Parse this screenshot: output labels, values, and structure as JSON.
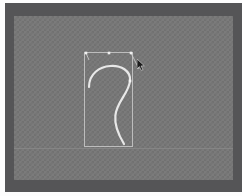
{
  "app": {
    "title": "Vector Path Editor",
    "canvas_label": "drawing-canvas",
    "background_style": "transparency-checkerboard"
  },
  "colors": {
    "page_margin": "#fdfdfd",
    "frame": "#59595b",
    "frame_shade": "#555557",
    "canvas_light": "#7b7b7b",
    "canvas_dark": "#717171",
    "path_stroke": "#e8e8e8",
    "selection_box": "#bdbdbd",
    "handle_line": "#cfcfcf",
    "handle_node": "#f0f0f0",
    "guide": "#969696",
    "cursor": "#1a1a1a"
  },
  "selection": {
    "label": "selection-bounding-box",
    "x": 70,
    "y": 36,
    "width": 48,
    "height": 94
  },
  "path": {
    "label": "bezier-curve-path",
    "stroke_width": 2.2,
    "fill": "none",
    "d": "M 75 71 C 75 44 118 44 116 65 C 114 84 88 92 110 128"
  },
  "handles": [
    {
      "name": "node-handle-top-left",
      "x": 72,
      "y": 37,
      "type": "anchor"
    },
    {
      "name": "node-handle-top-mid",
      "x": 95,
      "y": 37,
      "type": "control"
    },
    {
      "name": "node-handle-top-right",
      "x": 117,
      "y": 37,
      "type": "anchor"
    },
    {
      "name": "node-handle-curve-end",
      "x": 116,
      "y": 65,
      "type": "anchor"
    }
  ],
  "handle_lines": [
    {
      "name": "handle-line-left",
      "x1": 72,
      "y1": 37,
      "x2": 75,
      "y2": 44
    },
    {
      "name": "handle-line-right",
      "x1": 117,
      "y1": 37,
      "x2": 125,
      "y2": 53
    }
  ],
  "guide": {
    "label": "horizontal-guide",
    "y": 132
  },
  "cursor": {
    "label": "mouse-pointer",
    "x": 123,
    "y": 43
  }
}
